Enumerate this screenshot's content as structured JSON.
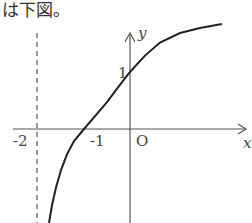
{
  "caption": "は下図。",
  "graph": {
    "function_description": "y = log2(x + 2)",
    "asymptote_label": "-2",
    "x_tick_label": "-1",
    "origin_label": "O",
    "y_tick_label": "1",
    "x_axis_label": "x",
    "y_axis_label": "y",
    "colors": {
      "axis": "#555555",
      "curve": "#222222",
      "asymptote": "#555555"
    }
  }
}
